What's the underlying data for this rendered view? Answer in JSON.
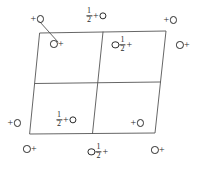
{
  "figure": {
    "cell_shape": "oblique-parallelogram",
    "divisions": "2 by 2",
    "line_color": "#555555",
    "symbol_color": "#2b2b2b",
    "background": "#ffffff"
  },
  "cell_outline": {
    "top_left": [
      40,
      33
    ],
    "top_right": [
      166,
      31
    ],
    "bottom_right": [
      155,
      133
    ],
    "bottom_left": [
      30,
      134
    ]
  },
  "grid_lines": {
    "vertical_mid_top": [
      103,
      32
    ],
    "vertical_mid_bottom": [
      92.5,
      133.5
    ],
    "horizontal_mid_left": [
      35,
      83.5
    ],
    "horizontal_mid_right": [
      160.5,
      82
    ]
  },
  "leader_line": {
    "from": [
      40,
      22
    ],
    "to": [
      58,
      42
    ]
  },
  "markers": [
    {
      "id": "top-left-outside",
      "name": "symbol-top-left-outside",
      "x": 37,
      "y": 19,
      "parts": [
        "sign:+",
        "circle",
        ""
      ],
      "label": "+O"
    },
    {
      "id": "top-center",
      "name": "symbol-top-center",
      "x": 96,
      "y": 16,
      "parts": [
        "frac:1/2",
        "sign:+",
        "circle"
      ],
      "label": "1/2+O"
    },
    {
      "id": "top-right-outside",
      "name": "symbol-top-right-outside",
      "x": 170,
      "y": 20,
      "parts": [
        "sign:+",
        "circle"
      ],
      "label": "+O"
    },
    {
      "id": "right-upper",
      "name": "symbol-right-upper-outside",
      "x": 183,
      "y": 45,
      "parts": [
        "circle",
        "sign:+"
      ],
      "label": "O+"
    },
    {
      "id": "inner-upper-left",
      "name": "symbol-inner-upper-left",
      "x": 57,
      "y": 44,
      "parts": [
        "circle",
        "sign:+"
      ],
      "label": "O+"
    },
    {
      "id": "inner-upper-right",
      "name": "symbol-inner-upper-right",
      "x": 122,
      "y": 45,
      "parts": [
        "circle",
        "frac:1/2",
        "sign:+"
      ],
      "label": "O1/2+"
    },
    {
      "id": "left-lower-outside",
      "name": "symbol-left-lower-outside",
      "x": 14,
      "y": 123,
      "parts": [
        "sign:+",
        "circle"
      ],
      "label": "+O"
    },
    {
      "id": "inner-lower-left",
      "name": "symbol-inner-lower-left",
      "x": 66,
      "y": 120,
      "parts": [
        "frac:1/2",
        "sign:+",
        "circle"
      ],
      "label": "1/2+O"
    },
    {
      "id": "inner-lower-right",
      "name": "symbol-inner-lower-right",
      "x": 137,
      "y": 123,
      "parts": [
        "sign:+",
        "circle"
      ],
      "label": "+O"
    },
    {
      "id": "bottom-left-outside",
      "name": "symbol-bottom-left-outside",
      "x": 30,
      "y": 149,
      "parts": [
        "circle",
        "sign:+"
      ],
      "label": "O+"
    },
    {
      "id": "bottom-center",
      "name": "symbol-bottom-center",
      "x": 98,
      "y": 152,
      "parts": [
        "circle",
        "frac:1/2",
        "sign:+"
      ],
      "label": "O1/2+"
    },
    {
      "id": "bottom-right-outside",
      "name": "symbol-bottom-right-outside",
      "x": 158,
      "y": 150,
      "parts": [
        "circle",
        "sign:+"
      ],
      "label": "O+"
    }
  ]
}
